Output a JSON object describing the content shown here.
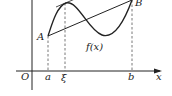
{
  "diagram": {
    "labels": {
      "origin": "O",
      "a": "a",
      "xi": "ξ",
      "b": "b",
      "x_axis": "x",
      "point_A": "A",
      "point_B": "B",
      "function": "f(x)"
    },
    "colors": {
      "stroke": "#222222",
      "dashed": "#555555",
      "background": "#ffffff"
    }
  }
}
